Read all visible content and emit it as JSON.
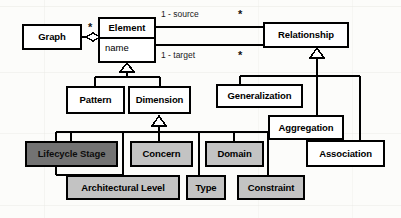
{
  "diagram": {
    "type": "uml-class-diagram",
    "colors": {
      "stroke": "#000000",
      "background": "#fcfcfa",
      "fill_white": "#ffffff",
      "fill_light_gray": "#c3c3c3",
      "fill_dark_gray": "#737373"
    },
    "classes": [
      {
        "id": "graph",
        "name": "Graph",
        "fill": "white",
        "x": 22,
        "y": 24,
        "w": 60,
        "h": 26
      },
      {
        "id": "element",
        "name": "Element",
        "attribute": "name",
        "fill": "white",
        "x": 98,
        "y": 17,
        "w": 58,
        "h": 46
      },
      {
        "id": "relationship",
        "name": "Relationship",
        "fill": "white",
        "x": 263,
        "y": 22,
        "w": 86,
        "h": 26
      },
      {
        "id": "pattern",
        "name": "Pattern",
        "fill": "white",
        "x": 66,
        "y": 86,
        "w": 59,
        "h": 28
      },
      {
        "id": "dimension",
        "name": "Dimension",
        "fill": "white",
        "x": 128,
        "y": 86,
        "w": 63,
        "h": 28
      },
      {
        "id": "generalization",
        "name": "Generalization",
        "fill": "white",
        "x": 216,
        "y": 84,
        "w": 87,
        "h": 24
      },
      {
        "id": "aggregation",
        "name": "Aggregation",
        "fill": "white",
        "x": 268,
        "y": 115,
        "w": 76,
        "h": 25
      },
      {
        "id": "association",
        "name": "Association",
        "fill": "white",
        "x": 306,
        "y": 140,
        "w": 79,
        "h": 27
      },
      {
        "id": "lifecycle-stage",
        "name": "Lifecycle Stage",
        "fill": "dark",
        "x": 25,
        "y": 141,
        "w": 93,
        "h": 26
      },
      {
        "id": "concern",
        "name": "Concern",
        "fill": "light",
        "x": 130,
        "y": 141,
        "w": 63,
        "h": 26
      },
      {
        "id": "domain",
        "name": "Domain",
        "fill": "light",
        "x": 205,
        "y": 141,
        "w": 59,
        "h": 26
      },
      {
        "id": "architectural-level",
        "name": "Architectural Level",
        "fill": "light",
        "x": 66,
        "y": 175,
        "w": 114,
        "h": 25
      },
      {
        "id": "type",
        "name": "Type",
        "fill": "light",
        "x": 186,
        "y": 175,
        "w": 40,
        "h": 25
      },
      {
        "id": "constraint",
        "name": "Constraint",
        "fill": "light",
        "x": 237,
        "y": 175,
        "w": 68,
        "h": 25
      }
    ],
    "edge_labels": [
      {
        "id": "source-role",
        "text": "1  - source",
        "x": 161,
        "y": 10
      },
      {
        "id": "target-role",
        "text": "1  - target",
        "x": 161,
        "y": 51
      }
    ],
    "multiplicities": [
      {
        "id": "graph-element-star",
        "text": "*",
        "x": 88,
        "y": 22
      },
      {
        "id": "relationship-source-star",
        "text": "*",
        "x": 238,
        "y": 9
      },
      {
        "id": "relationship-target-star",
        "text": "*",
        "x": 238,
        "y": 50
      }
    ],
    "relations": [
      {
        "id": "graph-aggregates-element",
        "kind": "aggregation",
        "from": "graph",
        "to": "element"
      },
      {
        "id": "element-source-relationship",
        "kind": "association",
        "from": "element",
        "to": "relationship",
        "role": "source"
      },
      {
        "id": "element-target-relationship",
        "kind": "association",
        "from": "element",
        "to": "relationship",
        "role": "target"
      },
      {
        "id": "pattern-isa-element",
        "kind": "generalization",
        "from": "pattern",
        "to": "element"
      },
      {
        "id": "dimension-isa-element",
        "kind": "generalization",
        "from": "dimension",
        "to": "element"
      },
      {
        "id": "lifecycle-isa-dimension",
        "kind": "generalization",
        "from": "lifecycle-stage",
        "to": "dimension"
      },
      {
        "id": "concern-isa-dimension",
        "kind": "generalization",
        "from": "concern",
        "to": "dimension"
      },
      {
        "id": "domain-isa-dimension",
        "kind": "generalization",
        "from": "domain",
        "to": "dimension"
      },
      {
        "id": "archlevel-isa-dimension",
        "kind": "generalization",
        "from": "architectural-level",
        "to": "dimension"
      },
      {
        "id": "type-isa-dimension",
        "kind": "generalization",
        "from": "type",
        "to": "dimension"
      },
      {
        "id": "constraint-isa-dimension",
        "kind": "generalization",
        "from": "constraint",
        "to": "dimension"
      },
      {
        "id": "generalization-isa-relationship",
        "kind": "generalization",
        "from": "generalization",
        "to": "relationship"
      },
      {
        "id": "aggregation-isa-relationship",
        "kind": "generalization",
        "from": "aggregation",
        "to": "relationship"
      },
      {
        "id": "association-isa-relationship",
        "kind": "generalization",
        "from": "association",
        "to": "relationship"
      }
    ]
  }
}
